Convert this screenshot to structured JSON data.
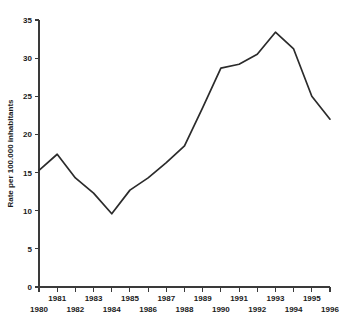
{
  "chart_data": {
    "type": "line",
    "title": "",
    "subtitle": "",
    "xlabel": "",
    "ylabel": "Rate per 100.000 inhabitants",
    "x": [
      1980,
      1981,
      1982,
      1983,
      1984,
      1985,
      1986,
      1987,
      1988,
      1989,
      1990,
      1991,
      1992,
      1993,
      1994,
      1995,
      1996
    ],
    "values": [
      15.3,
      17.4,
      14.3,
      12.3,
      9.6,
      12.7,
      14.3,
      16.3,
      18.5,
      23.5,
      28.7,
      29.2,
      30.5,
      33.4,
      31.2,
      25.0,
      22.0
    ],
    "series": [
      {
        "name": "Rate per 100.000 inhabitants",
        "values": [
          15.3,
          17.4,
          14.3,
          12.3,
          9.6,
          12.7,
          14.3,
          16.3,
          18.5,
          23.5,
          28.7,
          29.2,
          30.5,
          33.4,
          31.2,
          25.0,
          22.0
        ]
      }
    ],
    "xlim": [
      1980,
      1996
    ],
    "ylim": [
      0,
      35
    ],
    "y_ticks": [
      0,
      5,
      10,
      15,
      20,
      25,
      30,
      35
    ],
    "y_tick_labels": [
      "0",
      "5",
      "10",
      "15",
      "20",
      "25",
      "30",
      "35"
    ],
    "x_ticks": [
      1980,
      1981,
      1982,
      1983,
      1984,
      1985,
      1986,
      1987,
      1988,
      1989,
      1990,
      1991,
      1992,
      1993,
      1994,
      1995,
      1996
    ],
    "x_tick_labels": [
      "1980",
      "1981",
      "1982",
      "1983",
      "1984",
      "1985",
      "1986",
      "1987",
      "1988",
      "1989",
      "1990",
      "1991",
      "1992",
      "1993",
      "1994",
      "1995",
      "1996"
    ],
    "x_tick_label_rows": [
      1,
      0,
      1,
      0,
      1,
      0,
      1,
      0,
      1,
      0,
      1,
      0,
      1,
      0,
      1,
      0,
      1
    ],
    "grid": false,
    "legend": false,
    "legend_position": "none",
    "line_color": "#2b2b2b",
    "axis_color": "#3a3a3a",
    "text_color": "#1a1a1a",
    "background_color": "#ffffff",
    "annotations": []
  }
}
